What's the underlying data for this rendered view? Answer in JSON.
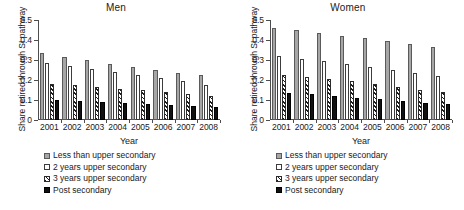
{
  "figure": {
    "ylabel": "Share retired through SI pathway",
    "xlabel": "Year"
  },
  "legend": {
    "items": [
      {
        "label": "Less than upper secondary",
        "marker": "gray-square"
      },
      {
        "label": "2 years upper secondary",
        "marker": "white-square"
      },
      {
        "label": "3 years upper secondary",
        "marker": "hatched-square"
      },
      {
        "label": "Post secondary",
        "marker": "black-square"
      }
    ]
  },
  "chart_data": [
    {
      "type": "bar",
      "title": "Men",
      "xlabel": "Year",
      "ylabel": "Share retired through SI pathway",
      "categories": [
        "2001",
        "2002",
        "2003",
        "2004",
        "2005",
        "2006",
        "2007",
        "2008"
      ],
      "ylim": [
        0,
        0.5
      ],
      "yticks": [
        "0",
        "0.1",
        "0.2",
        "0.3",
        "0.4",
        "0.5"
      ],
      "ytick_values": [
        0,
        0.1,
        0.2,
        0.3,
        0.4,
        0.5
      ],
      "grid": false,
      "legend_position": "below",
      "series": [
        {
          "name": "Less than upper secondary",
          "values": [
            0.335,
            0.315,
            0.3,
            0.28,
            0.265,
            0.25,
            0.235,
            0.225
          ]
        },
        {
          "name": "2 years upper secondary",
          "values": [
            0.285,
            0.27,
            0.255,
            0.24,
            0.225,
            0.21,
            0.195,
            0.175
          ]
        },
        {
          "name": "3 years upper secondary",
          "values": [
            0.18,
            0.175,
            0.165,
            0.155,
            0.15,
            0.14,
            0.13,
            0.118
          ]
        },
        {
          "name": "Post secondary",
          "values": [
            0.1,
            0.095,
            0.09,
            0.086,
            0.082,
            0.076,
            0.072,
            0.066
          ]
        }
      ]
    },
    {
      "type": "bar",
      "title": "Women",
      "xlabel": "Year",
      "ylabel": "Share retired through SI pathway",
      "categories": [
        "2001",
        "2002",
        "2003",
        "2004",
        "2005",
        "2006",
        "2007",
        "2008"
      ],
      "ylim": [
        0,
        0.5
      ],
      "yticks": [
        "0",
        "0.1",
        "0.2",
        "0.3",
        "0.4",
        "0.5"
      ],
      "ytick_values": [
        0,
        0.1,
        0.2,
        0.3,
        0.4,
        0.5
      ],
      "grid": false,
      "legend_position": "below",
      "series": [
        {
          "name": "Less than upper secondary",
          "values": [
            0.46,
            0.448,
            0.437,
            0.42,
            0.41,
            0.395,
            0.38,
            0.366
          ]
        },
        {
          "name": "2 years upper secondary",
          "values": [
            0.32,
            0.307,
            0.295,
            0.281,
            0.266,
            0.25,
            0.236,
            0.222
          ]
        },
        {
          "name": "3 years upper secondary",
          "values": [
            0.225,
            0.215,
            0.205,
            0.195,
            0.178,
            0.165,
            0.152,
            0.141
          ]
        },
        {
          "name": "Post secondary",
          "values": [
            0.135,
            0.128,
            0.12,
            0.112,
            0.103,
            0.095,
            0.087,
            0.079
          ]
        }
      ]
    }
  ]
}
